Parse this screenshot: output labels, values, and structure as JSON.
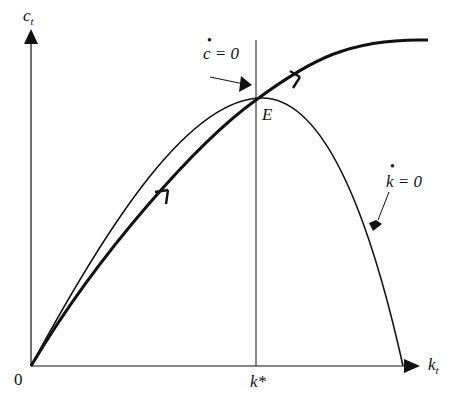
{
  "diagram": {
    "y_axis_label": "c",
    "y_axis_sub": "t",
    "x_axis_label": "k",
    "x_axis_sub": "t",
    "origin_label": "0",
    "steady_state_label": "E",
    "k_star_label": "k*",
    "c_dot_label": "c = 0",
    "k_dot_label": "k = 0",
    "colors": {
      "line": "#111111",
      "background": "#ffffff"
    }
  }
}
